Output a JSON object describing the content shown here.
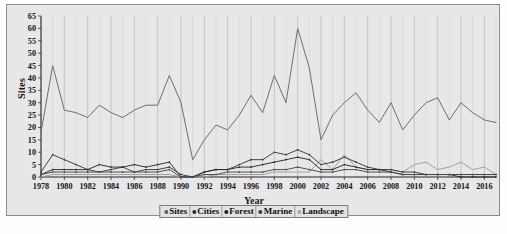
{
  "chart_data": {
    "type": "line",
    "title": "",
    "xlabel": "Year",
    "ylabel": "Sites",
    "ylim": [
      0,
      65
    ],
    "ytick_step": 5,
    "yticks": [
      0,
      5,
      10,
      15,
      20,
      25,
      30,
      35,
      40,
      45,
      50,
      55,
      60,
      65
    ],
    "xlim": [
      1978,
      2017
    ],
    "xticks": [
      1978,
      1980,
      1982,
      1984,
      1986,
      1988,
      1990,
      1992,
      1994,
      1996,
      1998,
      2000,
      2002,
      2004,
      2006,
      2008,
      2010,
      2012,
      2014,
      2016
    ],
    "grid": "vertical",
    "legend_position": "bottom-center",
    "x": [
      1978,
      1979,
      1980,
      1981,
      1982,
      1983,
      1984,
      1985,
      1986,
      1987,
      1988,
      1989,
      1990,
      1991,
      1992,
      1993,
      1994,
      1995,
      1996,
      1997,
      1998,
      1999,
      2000,
      2001,
      2002,
      2003,
      2004,
      2005,
      2006,
      2007,
      2008,
      2009,
      2010,
      2011,
      2012,
      2013,
      2014,
      2015,
      2016,
      2017
    ],
    "series": [
      {
        "name": "Sites",
        "color": "#6f6f6f",
        "values": [
          18,
          45,
          27,
          26,
          24,
          29,
          26,
          24,
          27,
          29,
          29,
          41,
          30,
          7,
          15,
          21,
          19,
          25,
          33,
          26,
          41,
          30,
          60,
          44,
          15,
          25,
          30,
          34,
          27,
          22,
          30,
          19,
          25,
          30,
          32,
          23,
          30,
          26,
          23,
          22
        ]
      },
      {
        "name": "Cities",
        "color": "#3a3a3a",
        "values": [
          2,
          9,
          7,
          5,
          3,
          2,
          3,
          4,
          2,
          3,
          3,
          4,
          1,
          0,
          2,
          3,
          3,
          5,
          7,
          7,
          10,
          9,
          11,
          9,
          5,
          6,
          8,
          6,
          4,
          3,
          3,
          2,
          2,
          1,
          1,
          1,
          1,
          1,
          1,
          1
        ]
      },
      {
        "name": "Forest",
        "color": "#2a2a2a",
        "values": [
          1,
          3,
          3,
          3,
          3,
          5,
          4,
          4,
          5,
          4,
          5,
          6,
          0,
          0,
          2,
          3,
          3,
          4,
          4,
          5,
          6,
          7,
          8,
          7,
          3,
          3,
          5,
          4,
          3,
          3,
          2,
          1,
          1,
          1,
          1,
          1,
          0,
          0,
          0,
          0
        ]
      },
      {
        "name": "Marine",
        "color": "#4a4a4a",
        "values": [
          1,
          2,
          2,
          2,
          2,
          2,
          2,
          2,
          2,
          2,
          2,
          3,
          0,
          0,
          1,
          1,
          2,
          2,
          2,
          2,
          3,
          3,
          4,
          3,
          2,
          2,
          3,
          3,
          2,
          2,
          2,
          1,
          1,
          1,
          1,
          1,
          1,
          1,
          1,
          1
        ]
      },
      {
        "name": "Landscape",
        "color": "#9d9d9d",
        "values": [
          0,
          1,
          1,
          1,
          1,
          1,
          1,
          1,
          1,
          1,
          1,
          1,
          0,
          0,
          0,
          1,
          1,
          1,
          1,
          1,
          2,
          2,
          2,
          2,
          7,
          3,
          9,
          4,
          3,
          3,
          3,
          2,
          5,
          6,
          3,
          4,
          6,
          3,
          4,
          1
        ]
      }
    ]
  },
  "legend": {
    "items": [
      {
        "label": "Sites",
        "color": "#5f5f5f"
      },
      {
        "label": "Cities",
        "color": "#2a2a2a"
      },
      {
        "label": "Forest",
        "color": "#202020"
      },
      {
        "label": "Marine",
        "color": "#3a3a3a"
      },
      {
        "label": "Landscape",
        "color": "#a5a5a5"
      }
    ]
  },
  "axes": {
    "y_title": "Sites",
    "x_title": "Year"
  }
}
